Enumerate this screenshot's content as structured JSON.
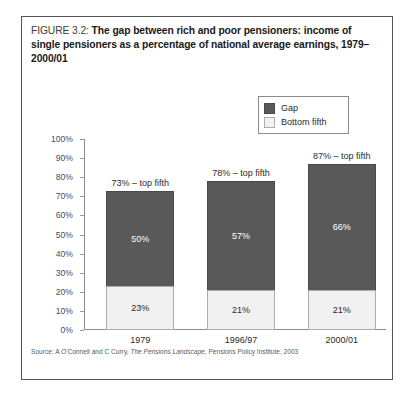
{
  "figure": {
    "label": "FIGURE 3.2:",
    "title": "The gap between rich and poor pensioners: income of single pensioners as a percentage of national average earnings, 1979–2000/01"
  },
  "source": {
    "prefix": "Source: A O'Connell and C Curry,",
    "publication": "The Pensions Landscape",
    "suffix": ", Pensions Policy Institute, 2003"
  },
  "legend": {
    "items": [
      {
        "label": "Gap",
        "color": "#595959"
      },
      {
        "label": "Bottom fifth",
        "color": "#f1f1f1"
      }
    ]
  },
  "chart_data": {
    "type": "bar",
    "subtype": "stacked-column",
    "title": "The gap between rich and poor pensioners: income of single pensioners as a percentage of national average earnings, 1979–2000/01",
    "xlabel": "",
    "ylabel": "",
    "ylim": [
      0,
      100
    ],
    "ytick_step": 10,
    "ytick_labels": [
      "0%",
      "10%",
      "20%",
      "30%",
      "40%",
      "50%",
      "60%",
      "70%",
      "80%",
      "90%",
      "100%"
    ],
    "grid": false,
    "legend_position": "top-right",
    "categories": [
      "1979",
      "1996/97",
      "2000/01"
    ],
    "series": [
      {
        "name": "Bottom fifth",
        "color": "#f1f1f1",
        "values": [
          23,
          21,
          21
        ],
        "value_labels": [
          "23%",
          "21%",
          "21%"
        ]
      },
      {
        "name": "Gap",
        "color": "#595959",
        "values": [
          50,
          57,
          66
        ],
        "value_labels": [
          "50%",
          "57%",
          "66%"
        ]
      }
    ],
    "totals": [
      73,
      78,
      87
    ],
    "total_labels": [
      "73% – top fifth",
      "78% – top fifth",
      "87% – top fifth"
    ]
  }
}
